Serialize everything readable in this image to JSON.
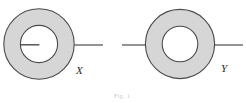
{
  "figure": {
    "canvas": {
      "width": 246,
      "height": 103,
      "background_color": "#ffffff"
    },
    "style": {
      "annulus_fill_color": "#d6d6d6",
      "annulus_stroke_color": "#4a4a4a",
      "inner_disc_fill_color": "#ffffff",
      "lead_line_color": "#4a4a4a",
      "label_color": "#2b2b2b"
    },
    "shapes": [
      {
        "name": "left-annulus",
        "center_x": 39,
        "center_y": 44,
        "outer_radius": 36,
        "inner_radius": 19,
        "has_internal_radius_line": true,
        "internal_radius_line_direction": "left",
        "label": "X",
        "label_x": 76,
        "label_y": 74,
        "lead_lines": [
          {
            "name": "left-lead-line-right",
            "x1": 75,
            "y1": 45,
            "x2": 103,
            "y2": 45
          }
        ]
      },
      {
        "name": "right-annulus",
        "center_x": 180,
        "center_y": 44,
        "outer_radius": 35,
        "inner_radius": 18,
        "has_internal_radius_line": false,
        "internal_radius_line_direction": "",
        "label": "Y",
        "label_x": 221,
        "label_y": 72,
        "lead_lines": [
          {
            "name": "right-lead-line-left",
            "x1": 122,
            "y1": 45,
            "x2": 145,
            "y2": 45
          },
          {
            "name": "right-lead-line-right",
            "x1": 215,
            "y1": 45,
            "x2": 243,
            "y2": 45
          }
        ]
      }
    ],
    "caption_remnant": {
      "text": "Fig. 1",
      "x": 114,
      "y": 94
    }
  }
}
